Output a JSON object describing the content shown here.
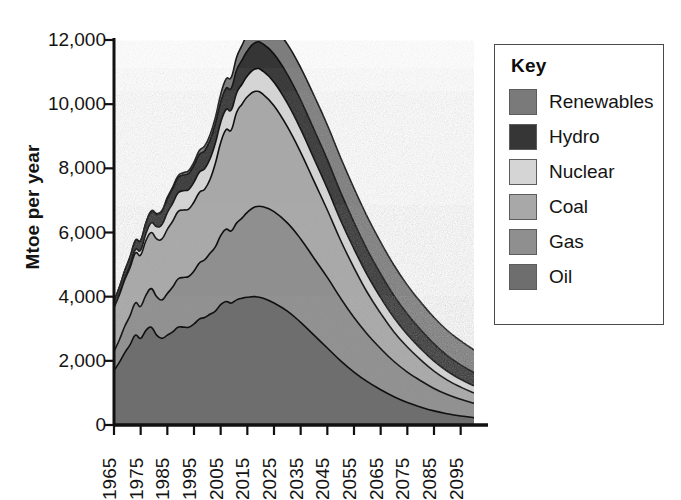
{
  "chart_data": {
    "type": "area",
    "stacked": true,
    "title": "",
    "subtitle": "",
    "xlabel": "",
    "ylabel": "Mtoe per year",
    "xlim": [
      1965,
      2100
    ],
    "ylim": [
      0,
      12000
    ],
    "grid": false,
    "legend_position": "right",
    "legend_title": "Key",
    "y_ticks": [
      "0",
      "2,000",
      "4,000",
      "6,000",
      "8,000",
      "10,000",
      "12,000"
    ],
    "y_tick_values": [
      0,
      2000,
      4000,
      6000,
      8000,
      10000,
      12000
    ],
    "x_ticks": [
      "1965",
      "1975",
      "1985",
      "1995",
      "2005",
      "2015",
      "2025",
      "2035",
      "2045",
      "2055",
      "2065",
      "2075",
      "2085",
      "2095"
    ],
    "x_tick_values": [
      1965,
      1975,
      1985,
      1995,
      2005,
      2015,
      2025,
      2035,
      2045,
      2055,
      2065,
      2075,
      2085,
      2095
    ],
    "x": [
      1965,
      1967,
      1969,
      1971,
      1973,
      1975,
      1977,
      1979,
      1981,
      1983,
      1985,
      1987,
      1989,
      1991,
      1993,
      1995,
      1997,
      1999,
      2001,
      2003,
      2005,
      2007,
      2009,
      2011,
      2013,
      2015,
      2018,
      2021,
      2025,
      2030,
      2035,
      2040,
      2045,
      2050,
      2055,
      2060,
      2065,
      2070,
      2075,
      2080,
      2085,
      2090,
      2095,
      2100
    ],
    "series": [
      {
        "name": "Oil",
        "color": "#6e6e6e",
        "values": [
          1700,
          1950,
          2250,
          2500,
          2800,
          2700,
          2950,
          3050,
          2800,
          2700,
          2800,
          2900,
          3050,
          3050,
          3050,
          3150,
          3300,
          3350,
          3450,
          3550,
          3750,
          3850,
          3800,
          3900,
          3950,
          3980,
          4000,
          3950,
          3800,
          3550,
          3200,
          2800,
          2400,
          2000,
          1650,
          1350,
          1100,
          880,
          700,
          560,
          440,
          350,
          280,
          230
        ]
      },
      {
        "name": "Gas",
        "color": "#8f8f8f",
        "values": [
          600,
          700,
          820,
          900,
          1000,
          1000,
          1100,
          1200,
          1200,
          1200,
          1300,
          1400,
          1500,
          1550,
          1580,
          1650,
          1750,
          1800,
          1900,
          2000,
          2150,
          2250,
          2250,
          2400,
          2500,
          2650,
          2800,
          2850,
          2850,
          2750,
          2600,
          2400,
          2200,
          1950,
          1700,
          1480,
          1280,
          1100,
          950,
          820,
          700,
          600,
          520,
          450
        ]
      },
      {
        "name": "Coal",
        "color": "#a8a8a8",
        "values": [
          1350,
          1400,
          1450,
          1500,
          1550,
          1600,
          1700,
          1750,
          1800,
          1900,
          2000,
          2050,
          2100,
          2100,
          2100,
          2150,
          2200,
          2200,
          2300,
          2600,
          2900,
          3100,
          3150,
          3450,
          3550,
          3600,
          3600,
          3500,
          3300,
          3000,
          2700,
          2400,
          2100,
          1800,
          1550,
          1300,
          1100,
          920,
          780,
          650,
          540,
          450,
          380,
          320
        ]
      },
      {
        "name": "Nuclear",
        "color": "#d5d5d5",
        "values": [
          10,
          20,
          40,
          70,
          110,
          150,
          220,
          300,
          380,
          450,
          520,
          560,
          580,
          600,
          610,
          620,
          630,
          640,
          640,
          630,
          630,
          630,
          620,
          600,
          620,
          650,
          700,
          720,
          730,
          730,
          720,
          700,
          670,
          630,
          590,
          540,
          490,
          440,
          390,
          350,
          310,
          275,
          245,
          220
        ]
      },
      {
        "name": "Hydro",
        "color": "#363636",
        "values": [
          200,
          220,
          240,
          260,
          280,
          300,
          330,
          350,
          380,
          400,
          430,
          450,
          470,
          490,
          500,
          520,
          550,
          560,
          580,
          600,
          630,
          660,
          680,
          720,
          750,
          780,
          820,
          850,
          880,
          900,
          910,
          910,
          900,
          870,
          830,
          790,
          740,
          690,
          640,
          590,
          540,
          490,
          450,
          410
        ]
      },
      {
        "name": "Renewables",
        "color": "#7a7a7a",
        "values": [
          5,
          5,
          8,
          10,
          12,
          15,
          20,
          25,
          30,
          35,
          45,
          55,
          65,
          75,
          90,
          105,
          125,
          145,
          170,
          200,
          240,
          290,
          340,
          400,
          460,
          520,
          620,
          700,
          820,
          940,
          1010,
          1060,
          1080,
          1080,
          1060,
          1030,
          990,
          950,
          900,
          860,
          820,
          780,
          745,
          710
        ]
      }
    ]
  },
  "legend": {
    "title": "Key",
    "items": [
      {
        "label": "Renewables",
        "color": "#7a7a7a"
      },
      {
        "label": "Hydro",
        "color": "#363636"
      },
      {
        "label": "Nuclear",
        "color": "#d5d5d5"
      },
      {
        "label": "Coal",
        "color": "#a8a8a8"
      },
      {
        "label": "Gas",
        "color": "#8f8f8f"
      },
      {
        "label": "Oil",
        "color": "#6e6e6e"
      }
    ]
  },
  "axes": {
    "y_title": "Mtoe per year",
    "axis_color": "#111111"
  }
}
